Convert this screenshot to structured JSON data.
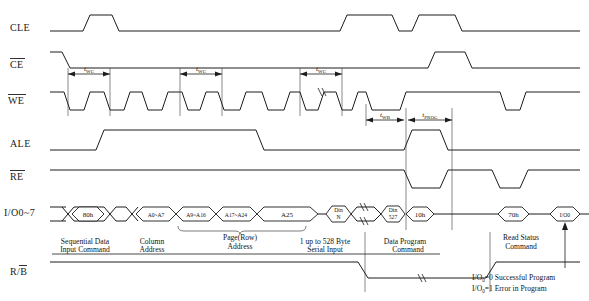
{
  "diagram": {
    "signals": [
      {
        "id": "cle",
        "label": "CLE",
        "overline": false,
        "y": 28
      },
      {
        "id": "ce",
        "label": "CE",
        "overline": true,
        "y": 64
      },
      {
        "id": "we",
        "label": "WE",
        "overline": true,
        "y": 100
      },
      {
        "id": "ale",
        "label": "ALE",
        "overline": false,
        "y": 143
      },
      {
        "id": "re",
        "label": "RE",
        "overline": true,
        "y": 176
      },
      {
        "id": "io",
        "label": "I/O0~7",
        "overline": false,
        "y": 213
      },
      {
        "id": "rb",
        "label": "R/B",
        "overline": true,
        "y": 272
      }
    ],
    "bus_cycles": [
      {
        "id": "cmd-80h",
        "text": "80h",
        "cx": 85,
        "w": 34,
        "two_line": false
      },
      {
        "id": "addr-a0",
        "text": "A0~A7",
        "cx": 152,
        "w": 42,
        "two_line": false
      },
      {
        "id": "addr-a9",
        "text": "A9~A16",
        "cx": 196,
        "w": 42,
        "two_line": false
      },
      {
        "id": "addr-a17",
        "text": "A17~A24",
        "cx": 240,
        "w": 42,
        "two_line": false
      },
      {
        "id": "addr-a25",
        "text": "A25",
        "cx": 290,
        "w": 54,
        "two_line": false
      },
      {
        "id": "din-n",
        "line1": "Din",
        "line2": "N",
        "cx": 338,
        "w": 22,
        "two_line": true
      },
      {
        "id": "din-527",
        "line1": "Din",
        "line2": "527",
        "cx": 387,
        "w": 22,
        "two_line": true
      },
      {
        "id": "cmd-10h",
        "text": "10h",
        "cx": 418,
        "w": 30,
        "two_line": false
      },
      {
        "id": "cmd-70h",
        "text": "70h",
        "cx": 513,
        "w": 28,
        "two_line": false
      },
      {
        "id": "io0-out",
        "text": "I/O0",
        "cx": 565,
        "w": 28,
        "two_line": false
      }
    ],
    "annotations": [
      {
        "id": "seq-data-cmd",
        "line1": "Sequential Data",
        "line2": "Input Command",
        "cx": 85,
        "y": 243
      },
      {
        "id": "col-addr",
        "line1": "Column",
        "line2": "Address",
        "cx": 152,
        "y": 243
      },
      {
        "id": "page-row",
        "line1": "Page(Row)",
        "line2": "Address",
        "cx": 240,
        "y": 239
      },
      {
        "id": "serial-input",
        "line1": "1 up to 528 Byte",
        "line2": "Serial Input",
        "cx": 330,
        "y": 243
      },
      {
        "id": "prog-cmd",
        "line1": "Data Program",
        "line2": "Command",
        "cx": 405,
        "y": 243
      },
      {
        "id": "read-status",
        "line1": "Read Status",
        "line2": "Command",
        "cx": 520,
        "y": 243
      }
    ],
    "status_notes": [
      {
        "id": "status-pass",
        "text": "I/O0 =0 Successful Program",
        "sub": "0",
        "pre": "I/O",
        "post": "=0 Successful Program",
        "x": 478,
        "y": 279
      },
      {
        "id": "status-fail",
        "text": "I/O0 =1 Error in Program",
        "sub": "0",
        "pre": "I/O",
        "post": "=1 Error in Program",
        "x": 478,
        "y": 291
      }
    ],
    "timings": [
      {
        "id": "twc-1",
        "name": "t",
        "sub": "WC",
        "x1": 68,
        "x2": 110,
        "y": 74,
        "label_y": 70
      },
      {
        "id": "twc-2",
        "name": "t",
        "sub": "WC",
        "x1": 180,
        "x2": 222,
        "y": 74,
        "label_y": 70
      },
      {
        "id": "twc-3",
        "name": "t",
        "sub": "WC",
        "x1": 308,
        "x2": 350,
        "y": 74,
        "label_y": 70
      },
      {
        "id": "twb",
        "name": "t",
        "sub": "WB",
        "x1": 366,
        "x2": 404,
        "y": 120,
        "label_y": 116
      },
      {
        "id": "tprog",
        "name": "t",
        "sub": "PROG",
        "x1": 406,
        "x2": 452,
        "y": 120,
        "label_y": 116
      }
    ],
    "colors": {
      "stroke": "#1c1c1c",
      "text": "#141414",
      "background": "#ffffff",
      "guide": "#3a3a3a"
    }
  }
}
